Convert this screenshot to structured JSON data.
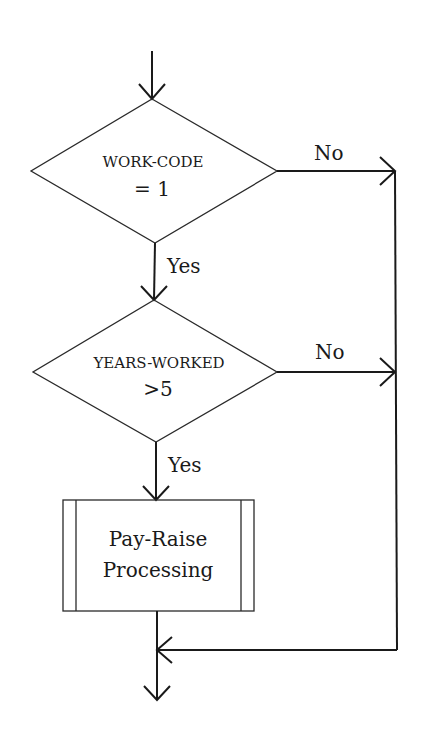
{
  "flowchart": {
    "decision1": {
      "line1": "WORK-CODE",
      "line2": "= 1",
      "yes_label": "Yes",
      "no_label": "No"
    },
    "decision2": {
      "line1": "YEARS-WORKED",
      "line2": ">5",
      "yes_label": "Yes",
      "no_label": "No"
    },
    "process": {
      "line1": "Pay-Raise",
      "line2": "Processing",
      "type": "predefined-process"
    },
    "colors": {
      "stroke": "#1a1a1a",
      "background": "#ffffff"
    }
  }
}
